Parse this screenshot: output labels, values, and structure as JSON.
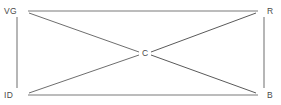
{
  "diagram": {
    "type": "node-link-graph",
    "background_color": "#ffffff",
    "edge_color": "#7a7a7a",
    "edge_color_strong": "#5a5a5a",
    "label_color": "#4a4a4a",
    "nodes": [
      {
        "id": "VG",
        "label": "VG",
        "x": 28,
        "y": 11,
        "label_x": 4,
        "label_y": 14,
        "anchor": "start"
      },
      {
        "id": "R",
        "label": "R",
        "x": 258,
        "y": 11,
        "label_x": 267,
        "label_y": 14,
        "anchor": "start"
      },
      {
        "id": "ID",
        "label": "ID",
        "x": 28,
        "y": 95,
        "label_x": 4,
        "label_y": 98,
        "anchor": "start"
      },
      {
        "id": "B",
        "label": "B",
        "x": 258,
        "y": 95,
        "label_x": 267,
        "label_y": 98,
        "anchor": "start"
      },
      {
        "id": "C",
        "label": "C",
        "x": 145,
        "y": 53,
        "label_x": 142,
        "label_y": 56,
        "anchor": "start"
      }
    ],
    "edges": [
      {
        "from": "VG",
        "to": "R",
        "x1": 28,
        "y1": 11,
        "x2": 258,
        "y2": 11,
        "width": 1.1,
        "color": "#7a7a7a"
      },
      {
        "from": "ID",
        "to": "B",
        "x1": 28,
        "y1": 95,
        "x2": 258,
        "y2": 95,
        "width": 1.1,
        "color": "#7a7a7a"
      },
      {
        "from": "VG",
        "to": "ID",
        "x1": 17,
        "y1": 17,
        "x2": 17,
        "y2": 88,
        "width": 1.1,
        "color": "#7a7a7a"
      },
      {
        "from": "R",
        "to": "B",
        "x1": 264,
        "y1": 17,
        "x2": 264,
        "y2": 88,
        "width": 1.1,
        "color": "#7a7a7a"
      },
      {
        "from": "VG",
        "to": "C",
        "x1": 29,
        "y1": 13,
        "x2": 139,
        "y2": 52,
        "width": 1.0,
        "color": "#6e6e6e"
      },
      {
        "from": "C",
        "to": "B",
        "x1": 151,
        "y1": 55,
        "x2": 256,
        "y2": 93,
        "width": 1.0,
        "color": "#5a5a5a"
      },
      {
        "from": "ID",
        "to": "C",
        "x1": 29,
        "y1": 93,
        "x2": 139,
        "y2": 55,
        "width": 1.0,
        "color": "#6e6e6e"
      },
      {
        "from": "C",
        "to": "R",
        "x1": 151,
        "y1": 52,
        "x2": 256,
        "y2": 13,
        "width": 1.0,
        "color": "#5a5a5a"
      }
    ]
  }
}
